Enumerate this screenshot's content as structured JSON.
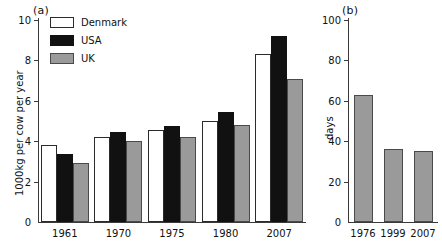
{
  "figure": {
    "panels": [
      {
        "tag": "(a)",
        "ylabel": "1000kg per cow per year"
      },
      {
        "tag": "(b)",
        "ylabel": "days"
      }
    ]
  },
  "legend": {
    "position": "top-left-inside",
    "items": [
      {
        "label": "Denmark",
        "key": "denmark",
        "color": "#ffffff"
      },
      {
        "label": "USA",
        "key": "usa",
        "color": "#111111"
      },
      {
        "label": "UK",
        "key": "uk",
        "color": "#9a9a9a"
      }
    ]
  },
  "chart_data": [
    {
      "type": "bar",
      "panel": "(a)",
      "title": "",
      "xlabel": "",
      "ylabel": "1000kg per cow per year",
      "categories": [
        "1961",
        "1970",
        "1975",
        "1980",
        "2007"
      ],
      "ylim": [
        0,
        10
      ],
      "yticks": [
        0,
        2,
        4,
        6,
        8,
        10
      ],
      "grid": false,
      "legend": "inside top-left",
      "series": [
        {
          "name": "Denmark",
          "color": "#ffffff",
          "values": [
            3.8,
            4.2,
            4.55,
            5.0,
            8.3
          ]
        },
        {
          "name": "USA",
          "color": "#111111",
          "values": [
            3.35,
            4.45,
            4.75,
            5.45,
            9.2
          ]
        },
        {
          "name": "UK",
          "color": "#9a9a9a",
          "values": [
            2.9,
            4.0,
            4.2,
            4.8,
            7.1
          ]
        }
      ]
    },
    {
      "type": "bar",
      "panel": "(b)",
      "title": "",
      "xlabel": "",
      "ylabel": "days",
      "categories": [
        "1976",
        "1999",
        "2007"
      ],
      "values": [
        63,
        36,
        35
      ],
      "ylim": [
        0,
        100
      ],
      "yticks": [
        0,
        20,
        40,
        60,
        80,
        100
      ],
      "grid": false,
      "color": "#9a9a9a"
    }
  ]
}
